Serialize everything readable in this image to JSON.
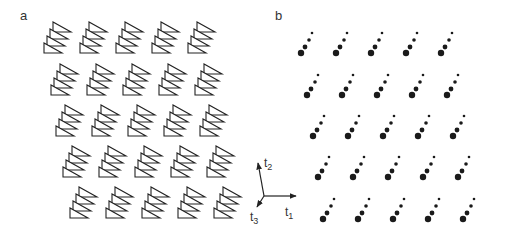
{
  "panels": {
    "a": {
      "label": "a",
      "description": "lattice of stacked triangle motifs",
      "rows": 5,
      "cols": 5,
      "row_origins": [
        [
          44,
          53
        ],
        [
          51,
          95
        ],
        [
          56,
          136
        ],
        [
          63,
          177
        ],
        [
          70,
          218
        ]
      ],
      "col_spacing": 36,
      "motif": {
        "triangles_per_stack": 4,
        "width": 18,
        "height": 10,
        "step_x": 3,
        "step_y": -7
      }
    },
    "b": {
      "label": "b",
      "description": "lattice of graded dot chains",
      "rows": 5,
      "cols": 5,
      "row_origins": [
        [
          301,
          53
        ],
        [
          307,
          95
        ],
        [
          313,
          136
        ],
        [
          318,
          177
        ],
        [
          323,
          219
        ]
      ],
      "col_spacing": 35,
      "motif": {
        "dots": [
          [
            0,
            0,
            3.2
          ],
          [
            4,
            -6,
            2.4
          ],
          [
            8,
            -13,
            1.8
          ],
          [
            11,
            -20,
            1.3
          ]
        ]
      }
    }
  },
  "axes": {
    "origin": [
      264,
      196
    ],
    "t1": {
      "label": "t",
      "subscript": "1",
      "end": [
        296,
        196
      ]
    },
    "t2": {
      "label": "t",
      "subscript": "2",
      "end": [
        258,
        163
      ]
    },
    "t3": {
      "label": "t",
      "subscript": "3",
      "end": [
        257,
        207
      ]
    }
  },
  "colors": {
    "stroke": "#222222",
    "dot": "#1a1a1a",
    "label": "#333333"
  }
}
